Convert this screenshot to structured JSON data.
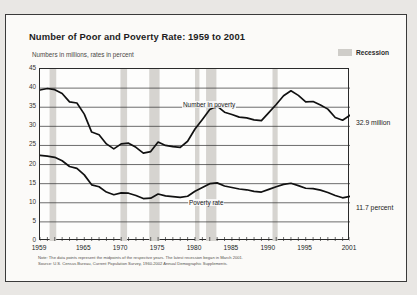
{
  "figure": {
    "title": "Number of Poor and Poverty Rate:  1959 to 2001",
    "subtitle": "Numbers in millions, rates in percent",
    "legend": {
      "label": "Recession",
      "swatch_color": "#cfcdc9"
    },
    "notes": [
      "Note:  The data points represent the midpoints of the respective years.  The latest recession began in March 2001.",
      "Source:  U.S. Census Bureau, Current Population Survey, 1960-2002 Annual Demographic Supplements."
    ]
  },
  "annotations": {
    "number_end_label": "32.9 million",
    "rate_end_label": "11.7 percent",
    "number_series_label": "Number in poverty",
    "rate_series_label": "Poverty rate"
  },
  "chart_data": {
    "type": "line",
    "title": "Number of Poor and Poverty Rate:  1959 to 2001",
    "subtitle": "Numbers in millions, rates in percent",
    "xlabel": "",
    "ylabel": "Numbers in millions, rates in percent",
    "xlim": [
      1959,
      2001
    ],
    "ylim": [
      0,
      45
    ],
    "yticks": [
      0,
      5,
      10,
      15,
      20,
      25,
      30,
      35,
      40,
      45
    ],
    "xticks": [
      1959,
      1965,
      1970,
      1975,
      1980,
      1985,
      1990,
      1995,
      2001
    ],
    "xtick_labels": [
      "1959",
      "1965",
      "1970",
      "1975",
      "1980",
      "1985",
      "1990",
      "1995",
      "2001"
    ],
    "grid": true,
    "legend_position": "top-right",
    "line_color": "#111111",
    "x": [
      1959,
      1960,
      1961,
      1962,
      1963,
      1964,
      1965,
      1966,
      1967,
      1968,
      1969,
      1970,
      1971,
      1972,
      1973,
      1974,
      1975,
      1976,
      1977,
      1978,
      1979,
      1980,
      1981,
      1982,
      1983,
      1984,
      1985,
      1986,
      1987,
      1988,
      1989,
      1990,
      1991,
      1992,
      1993,
      1994,
      1995,
      1996,
      1997,
      1998,
      1999,
      2000,
      2001
    ],
    "series": [
      {
        "name": "Number in poverty",
        "units": "millions",
        "values": [
          39.5,
          39.9,
          39.6,
          38.6,
          36.4,
          36.1,
          33.2,
          28.5,
          27.8,
          25.4,
          24.1,
          25.4,
          25.6,
          24.5,
          23.0,
          23.4,
          25.9,
          25.0,
          24.7,
          24.5,
          26.1,
          29.3,
          31.8,
          34.4,
          35.3,
          33.7,
          33.1,
          32.4,
          32.2,
          31.7,
          31.5,
          33.6,
          35.7,
          38.0,
          39.3,
          38.1,
          36.4,
          36.5,
          35.6,
          34.5,
          32.3,
          31.6,
          32.9
        ]
      },
      {
        "name": "Poverty rate",
        "units": "percent",
        "values": [
          22.4,
          22.2,
          21.9,
          21.0,
          19.5,
          19.0,
          17.3,
          14.7,
          14.2,
          12.8,
          12.1,
          12.6,
          12.5,
          11.9,
          11.1,
          11.2,
          12.3,
          11.8,
          11.6,
          11.4,
          11.7,
          13.0,
          14.0,
          15.0,
          15.2,
          14.4,
          14.0,
          13.6,
          13.4,
          13.0,
          12.8,
          13.5,
          14.2,
          14.8,
          15.1,
          14.5,
          13.8,
          13.7,
          13.3,
          12.7,
          11.9,
          11.3,
          11.7
        ]
      }
    ],
    "recession_bands": [
      {
        "start": 1960.3,
        "end": 1961.2
      },
      {
        "start": 1969.9,
        "end": 1970.8
      },
      {
        "start": 1973.8,
        "end": 1975.2
      },
      {
        "start": 1980.0,
        "end": 1980.6
      },
      {
        "start": 1981.5,
        "end": 1982.9
      },
      {
        "start": 1990.5,
        "end": 1991.2
      },
      {
        "start": 2001.2,
        "end": 2001.0
      }
    ]
  }
}
